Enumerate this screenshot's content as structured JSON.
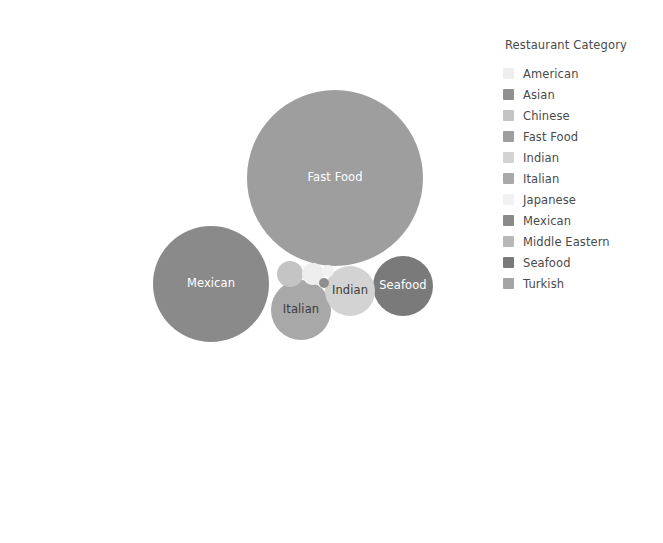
{
  "legend": {
    "title": "Restaurant Category",
    "position": "right",
    "items": [
      {
        "label": "American",
        "color": "#eeeeee"
      },
      {
        "label": "Asian",
        "color": "#8f8f8f"
      },
      {
        "label": "Chinese",
        "color": "#c4c4c4"
      },
      {
        "label": "Fast Food",
        "color": "#9e9e9e"
      },
      {
        "label": "Indian",
        "color": "#d3d3d3"
      },
      {
        "label": "Italian",
        "color": "#a8a8a8"
      },
      {
        "label": "Japanese",
        "color": "#f2f2f2"
      },
      {
        "label": "Mexican",
        "color": "#8a8a8a"
      },
      {
        "label": "Middle Eastern",
        "color": "#b8b8b8"
      },
      {
        "label": "Seafood",
        "color": "#7a7a7a"
      },
      {
        "label": "Turkish",
        "color": "#a5a5a5"
      }
    ]
  },
  "chart_data": {
    "type": "bubble",
    "title": "",
    "xlabel": "",
    "ylabel": "",
    "grid": false,
    "legend_title": "Restaurant Category",
    "legend_position": "right",
    "categories": [
      "American",
      "Asian",
      "Chinese",
      "Fast Food",
      "Indian",
      "Italian",
      "Japanese",
      "Mexican",
      "Middle Eastern",
      "Seafood",
      "Turkish"
    ],
    "bubbles": [
      {
        "name": "middle-eastern",
        "label": "Middle Eastern",
        "category": "Middle Eastern",
        "color": "#b8b8b8",
        "label_color": "#3c3c3c",
        "cx": 155,
        "cy": 140,
        "r": 102,
        "show_label": true
      },
      {
        "name": "fast-food",
        "label": "Fast Food",
        "category": "Fast Food",
        "color": "#9e9e9e",
        "label_color": "#ffffff",
        "cx": 335,
        "cy": 178,
        "r": 88,
        "show_label": true
      },
      {
        "name": "turkish",
        "label": "Turkish",
        "category": "Turkish",
        "color": "#a5a5a5",
        "label_color": "#3c3c3c",
        "cx": 385,
        "cy": 415,
        "r": 103,
        "show_label": true
      },
      {
        "name": "mexican",
        "label": "Mexican",
        "category": "Mexican",
        "color": "#8a8a8a",
        "label_color": "#ffffff",
        "cx": 211,
        "cy": 284,
        "r": 58,
        "show_label": true
      },
      {
        "name": "seafood",
        "label": "Seafood",
        "category": "Seafood",
        "color": "#7a7a7a",
        "label_color": "#ffffff",
        "cx": 403,
        "cy": 286,
        "r": 30,
        "show_label": true
      },
      {
        "name": "italian",
        "label": "Italian",
        "category": "Italian",
        "color": "#a8a8a8",
        "label_color": "#3c3c3c",
        "cx": 301,
        "cy": 310,
        "r": 30,
        "show_label": true
      },
      {
        "name": "indian",
        "label": "Indian",
        "category": "Indian",
        "color": "#d3d3d3",
        "label_color": "#3c3c3c",
        "cx": 350,
        "cy": 291,
        "r": 25,
        "show_label": true
      },
      {
        "name": "chinese",
        "label": "Chinese",
        "category": "Chinese",
        "color": "#c4c4c4",
        "label_color": "#3c3c3c",
        "cx": 290,
        "cy": 274,
        "r": 13,
        "show_label": false
      },
      {
        "name": "american",
        "label": "American",
        "category": "American",
        "color": "#eeeeee",
        "label_color": "#3c3c3c",
        "cx": 313,
        "cy": 274,
        "r": 11,
        "show_label": false
      },
      {
        "name": "japanese",
        "label": "Japanese",
        "category": "Japanese",
        "color": "#f2f2f2",
        "label_color": "#3c3c3c",
        "cx": 328,
        "cy": 271,
        "r": 6,
        "show_label": false
      },
      {
        "name": "asian",
        "label": "Asian",
        "category": "Asian",
        "color": "#8f8f8f",
        "label_color": "#ffffff",
        "cx": 324,
        "cy": 283,
        "r": 5,
        "show_label": false
      }
    ]
  }
}
